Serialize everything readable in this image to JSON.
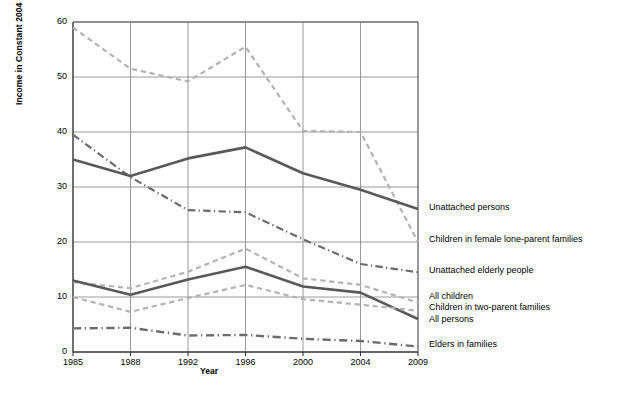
{
  "chart_data": {
    "type": "line",
    "title": "",
    "xlabel": "Year",
    "ylabel": "Income in Constant 2004 Dollars",
    "x": [
      1985,
      1988,
      1992,
      1996,
      2000,
      2004,
      2009
    ],
    "xtick_labels": [
      "1985",
      "1988",
      "1992",
      "1996",
      "2000",
      "2004",
      "2009"
    ],
    "ytick_labels": [
      "0",
      "10",
      "20",
      "30",
      "40",
      "50",
      "60"
    ],
    "yticks": [
      0,
      10,
      20,
      30,
      40,
      50,
      60
    ],
    "ylim": [
      0,
      60
    ],
    "grid": true,
    "legend_position": "right-inline-labels",
    "series": [
      {
        "name": "Children in female lone-parent families",
        "style": "dashed",
        "color": "#b3b3b3",
        "width": 2.2,
        "values": [
          59.0,
          51.5,
          49.2,
          55.5,
          40.2,
          40.0,
          20.0
        ],
        "label_y": 240
      },
      {
        "name": "Unattached elderly people",
        "style": "dashdot",
        "color": "#6b6b6b",
        "width": 2.2,
        "values": [
          39.5,
          31.8,
          25.8,
          25.4,
          20.5,
          16.0,
          14.5
        ],
        "label_y": 271
      },
      {
        "name": "Unattached persons",
        "style": "solid",
        "color": "#595959",
        "width": 2.6,
        "values": [
          35.0,
          32.0,
          35.2,
          37.2,
          32.5,
          29.5,
          26.0
        ],
        "label_y": 208
      },
      {
        "name": "All children",
        "style": "dashed",
        "color": "#b3b3b3",
        "width": 2.2,
        "values": [
          12.7,
          11.6,
          14.6,
          18.8,
          13.4,
          12.2,
          9.0
        ],
        "label_y": 297
      },
      {
        "name": "All persons",
        "style": "solid",
        "color": "#595959",
        "width": 2.6,
        "values": [
          13.0,
          10.4,
          13.2,
          15.5,
          11.9,
          10.8,
          6.0
        ],
        "label_y": 320
      },
      {
        "name": "Children in two-parent families",
        "style": "dashed",
        "color": "#b3b3b3",
        "width": 2.2,
        "values": [
          10.0,
          7.3,
          9.8,
          12.2,
          9.6,
          8.6,
          7.5
        ],
        "label_y": 308
      },
      {
        "name": "Elders in families",
        "style": "dashdot",
        "color": "#6b6b6b",
        "width": 2.4,
        "values": [
          4.3,
          4.4,
          3.0,
          3.1,
          2.4,
          2.0,
          1.0
        ],
        "label_y": 345
      }
    ]
  },
  "axes": {
    "plot_left": 73,
    "plot_right": 418,
    "plot_top": 22,
    "plot_bottom": 352
  }
}
